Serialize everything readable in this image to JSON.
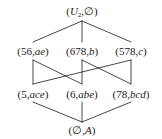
{
  "diagram": {
    "type": "lattice",
    "colors": {
      "line": "#333333",
      "text": "#1a1a1a",
      "background": "#ffffff"
    },
    "nodes": [
      {
        "id": "top",
        "extent": "U",
        "extent_sub": "2",
        "intent": "∅",
        "x": 82,
        "y": 12
      },
      {
        "id": "n56",
        "extent": "56",
        "intent": "ae",
        "x": 33,
        "y": 51
      },
      {
        "id": "n678",
        "extent": "678",
        "intent": "b",
        "x": 82,
        "y": 51
      },
      {
        "id": "n578",
        "extent": "578",
        "intent": "c",
        "x": 131,
        "y": 51
      },
      {
        "id": "n5",
        "extent": "5",
        "intent": "ace",
        "x": 33,
        "y": 94
      },
      {
        "id": "n6",
        "extent": "6",
        "intent": "abe",
        "x": 82,
        "y": 94
      },
      {
        "id": "n78",
        "extent": "78",
        "intent": "bcd",
        "x": 131,
        "y": 94
      },
      {
        "id": "bottom",
        "extent": "∅",
        "intent": "A",
        "x": 82,
        "y": 130
      }
    ],
    "edges": [
      {
        "from": "top",
        "to": "n56"
      },
      {
        "from": "top",
        "to": "n678"
      },
      {
        "from": "top",
        "to": "n578"
      },
      {
        "from": "n56",
        "to": "n5"
      },
      {
        "from": "n56",
        "to": "n6"
      },
      {
        "from": "n678",
        "to": "n6"
      },
      {
        "from": "n678",
        "to": "n78"
      },
      {
        "from": "n578",
        "to": "n5"
      },
      {
        "from": "n578",
        "to": "n78"
      },
      {
        "from": "n5",
        "to": "bottom"
      },
      {
        "from": "n6",
        "to": "bottom"
      },
      {
        "from": "n78",
        "to": "bottom"
      }
    ]
  },
  "labels": {
    "top": {
      "open": "(",
      "extent": "U",
      "sub": "2",
      "sep": ",",
      "intent": "∅",
      "close": ")"
    },
    "n56": {
      "open": "(",
      "extent": "56",
      "sep": ",",
      "intent": "ae",
      "close": ")"
    },
    "n678": {
      "open": "(",
      "extent": "678",
      "sep": ",",
      "intent": "b",
      "close": ")"
    },
    "n578": {
      "open": "(",
      "extent": "578",
      "sep": ",",
      "intent": "c",
      "close": ")"
    },
    "n5": {
      "open": "(",
      "extent": "5",
      "sep": ",",
      "intent": "ace",
      "close": ")"
    },
    "n6": {
      "open": "(",
      "extent": "6",
      "sep": ",",
      "intent": "abe",
      "close": ")"
    },
    "n78": {
      "open": "(",
      "extent": "78",
      "sep": ",",
      "intent": "bcd",
      "close": ")"
    },
    "bottom": {
      "open": "(",
      "extent": "∅",
      "sep": ",",
      "intent": "A",
      "close": ")"
    }
  }
}
